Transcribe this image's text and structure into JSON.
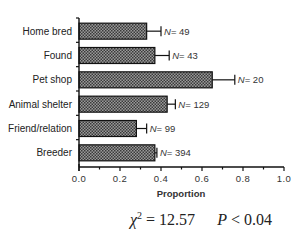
{
  "chart_data": {
    "type": "bar",
    "orientation": "horizontal",
    "title": "",
    "xlabel": "Proportion",
    "ylabel": "",
    "xlim": [
      0.0,
      1.0
    ],
    "xticks": [
      "0.0",
      "0.2",
      "0.4",
      "0.6",
      "0.8",
      "1.0"
    ],
    "grid": false,
    "legend": null,
    "categories": [
      "Home bred",
      "Found",
      "Pet shop",
      "Animal shelter",
      "Friend/relation",
      "Breeder"
    ],
    "values": [
      0.33,
      0.37,
      0.65,
      0.43,
      0.28,
      0.37
    ],
    "error_upper": [
      0.4,
      0.44,
      0.76,
      0.47,
      0.33,
      0.38
    ],
    "n_labels": [
      "N= 49",
      "N= 43",
      "N= 20",
      "N= 129",
      "N= 99",
      "N= 394"
    ],
    "n_values": [
      49,
      43,
      20,
      129,
      99,
      394
    ],
    "annotation": {
      "chi_symbol": "χ",
      "chi_exp": "2",
      "chi_value": "= 12.57",
      "p_symbol": "P",
      "p_value": "< 0.04"
    },
    "bar_color": "#555555"
  }
}
